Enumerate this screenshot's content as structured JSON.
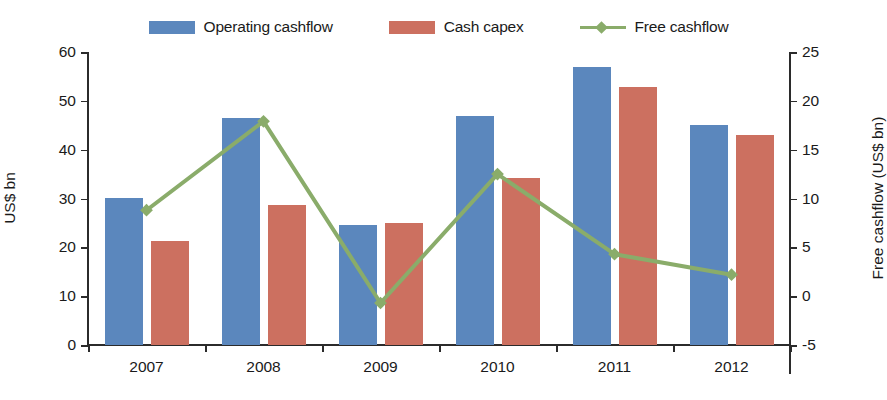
{
  "legend": {
    "items": [
      {
        "label": "Operating cashflow",
        "type": "swatch",
        "color": "#5b87bd",
        "name": "legend-operating-cashflow"
      },
      {
        "label": "Cash capex",
        "type": "swatch",
        "color": "#cc7060",
        "name": "legend-cash-capex"
      },
      {
        "label": "Free cashflow",
        "type": "line",
        "color": "#8aac6a",
        "name": "legend-free-cashflow"
      }
    ]
  },
  "axes": {
    "left": {
      "title": "US$ bn",
      "ticks": [
        "0",
        "10",
        "20",
        "30",
        "40",
        "50",
        "60"
      ],
      "min": 0,
      "max": 60
    },
    "right": {
      "title": "Free cashflow (US$ bn)",
      "ticks": [
        "-5",
        "0",
        "5",
        "10",
        "15",
        "20",
        "25"
      ],
      "min": -5,
      "max": 25
    },
    "x": {
      "ticks": [
        "2007",
        "2008",
        "2009",
        "2010",
        "2011",
        "2012"
      ]
    }
  },
  "chart_data": {
    "type": "bar",
    "title": "",
    "xlabel": "",
    "ylabel": "US$ bn",
    "y2label": "Free cashflow (US$ bn)",
    "categories": [
      "2007",
      "2008",
      "2009",
      "2010",
      "2011",
      "2012"
    ],
    "ylim": [
      0,
      60
    ],
    "y2lim": [
      -5,
      25
    ],
    "grid": false,
    "legend_position": "top-center",
    "series": [
      {
        "name": "Operating cashflow",
        "type": "bar",
        "axis": "left",
        "color": "#5b87bd",
        "values": [
          30.1,
          46.5,
          24.5,
          46.9,
          57.0,
          45.0
        ]
      },
      {
        "name": "Cash capex",
        "type": "bar",
        "axis": "left",
        "color": "#cc7060",
        "values": [
          21.2,
          28.7,
          25.0,
          34.2,
          52.8,
          43.0
        ]
      },
      {
        "name": "Free cashflow",
        "type": "line",
        "axis": "right",
        "color": "#8aac6a",
        "marker": "diamond",
        "values": [
          8.8,
          17.9,
          -0.7,
          12.5,
          4.3,
          2.2
        ]
      }
    ]
  }
}
